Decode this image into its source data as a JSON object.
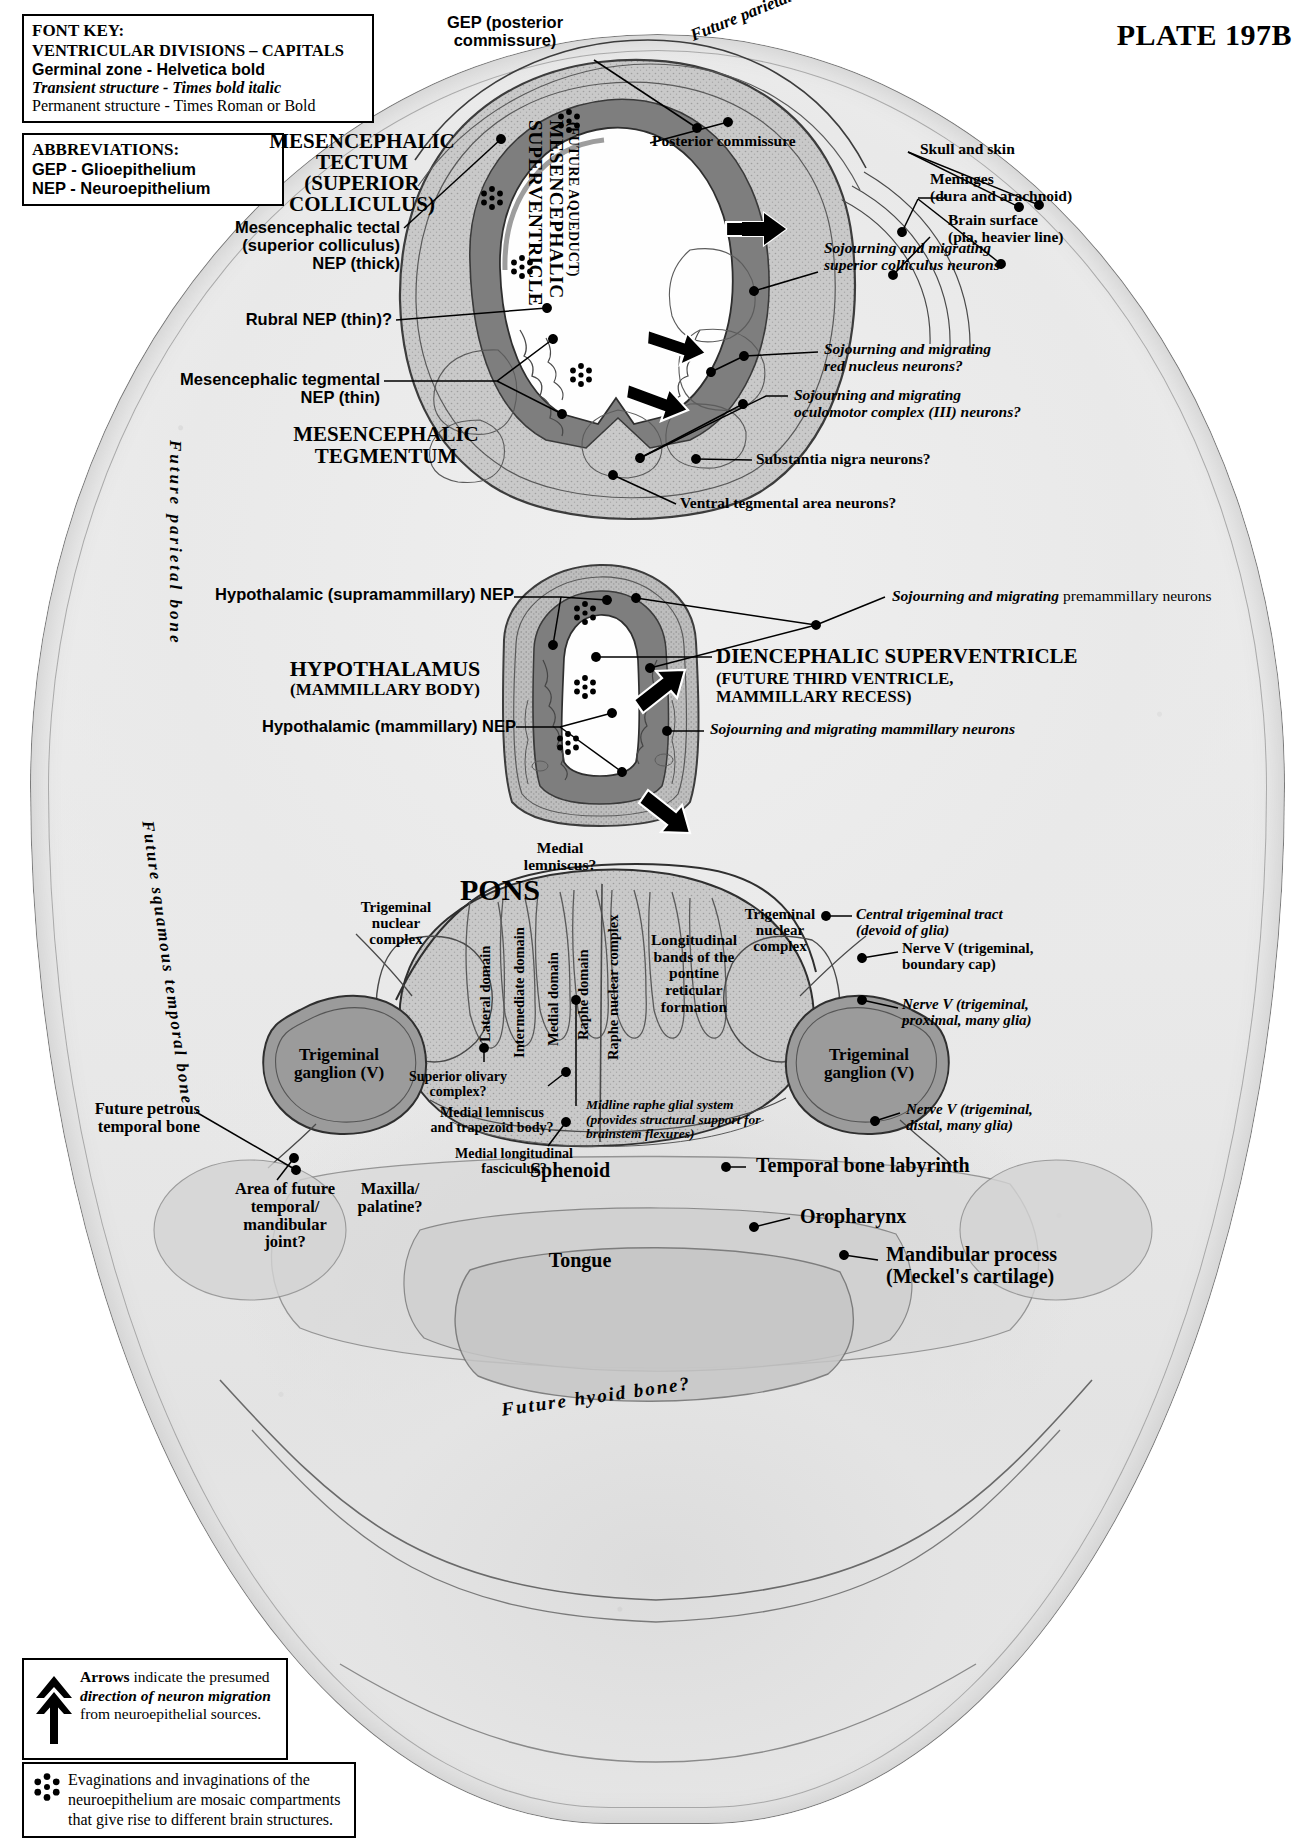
{
  "plate": {
    "title": "PLATE 197B"
  },
  "font_key": {
    "heading": "FONT KEY:",
    "lines": [
      "VENTRICULAR DIVISIONS – CAPITALS",
      "Germinal zone - Helvetica bold",
      "Transient structure - Times bold italic",
      "Permanent structure - Times Roman or Bold"
    ]
  },
  "abbreviations": {
    "heading": "ABBREVIATIONS:",
    "items": [
      "GEP - Glioepithelium",
      "NEP - Neuroepithelium"
    ]
  },
  "legend_arrows": {
    "bold_word": "Arrows",
    "text_1": " indicate the presumed ",
    "italic_phrase": "direction of neuron migration",
    "text_2": " from neuroepithelial sources."
  },
  "legend_star": {
    "text": "Evaginations and invaginations of the neuroepithelium are mosaic compartments that give rise to different brain structures."
  },
  "labels": {
    "gep_posterior_commissure": "GEP (posterior\ncommissure)",
    "posterior_commissure": "Posterior commissure",
    "future_parietal_bone_top": "Future parietal bone",
    "skull_and_skin": "Skull and skin",
    "meninges": "Meninges\n(dura and arachnoid)",
    "brain_surface": "Brain surface\n(pia, heavier line)",
    "mesencephalic_tectum": "MESENCEPHALIC\nTECTUM\n(SUPERIOR\nCOLLICULUS)",
    "mesencephalic_superventricle": "MESENCEPHALIC\nSUPERVENTRICLE",
    "mesencephalic_superventricle_sub": "(FUTURE AQUEDUCT)",
    "mesencephalic_tectal_nep": "Mesencephalic tectal\n(superior colliculus)\nNEP (thick)",
    "rubral_nep": "Rubral NEP (thin)?",
    "mesencephalic_tegmental_nep": "Mesencephalic tegmental\nNEP (thin)",
    "mesencephalic_tegmentum": "MESENCEPHALIC\nTEGMENTUM",
    "sojourning_superior_colliculus": "Sojourning and migrating\nsuperior colliculus neurons",
    "sojourning_red_nucleus": "Sojourning and migrating\nred nucleus neurons?",
    "sojourning_oculomotor": "Sojourning and migrating\noculomotor complex (III) neurons?",
    "substantia_nigra": "Substantia nigra neurons?",
    "ventral_tegmental": "Ventral tegmental area neurons?",
    "future_parietal_bone_left": "Future parietal bone",
    "future_squamous_temporal_bone": "Future squamous temporal bone",
    "hypothalamic_supramammillary_nep": "Hypothalamic (supramammillary) NEP",
    "sojourning_premammillary_italic": "Sojourning and migrating",
    "sojourning_premammillary_roman": " premammillary neurons",
    "hypothalamus": "HYPOTHALAMUS",
    "hypothalamus_sub": "(MAMMILLARY BODY)",
    "diencephalic_superventricle": "DIENCEPHALIC SUPERVENTRICLE",
    "diencephalic_superventricle_sub": "(FUTURE THIRD VENTRICLE,\nMAMMILLARY RECESS)",
    "hypothalamic_mammillary_nep": "Hypothalamic (mammillary) NEP",
    "sojourning_mammillary": "Sojourning and migrating mammillary neurons",
    "medial_lemniscus": "Medial\nlemniscus?",
    "pons": "PONS",
    "trigeminal_nuclear_complex_left": "Trigeminal\nnuclear\ncomplex",
    "trigeminal_nuclear_complex_right": "Trigeminal\nnuclear\ncomplex",
    "lateral_domain": "Lateral domain",
    "intermediate_domain": "Intermediate domain",
    "medial_domain": "Medial domain",
    "raphe_domain": "Raphe domain",
    "raphe_nuclear_complex": "Raphe nuclear complex",
    "longitudinal_bands": "Longitudinal\nbands of the\npontine\nreticular\nformation",
    "central_trigeminal_tract": "Central trigeminal tract\n(devoid of glia)",
    "nerve_v_boundary_cap": "Nerve V (trigeminal,\nboundary cap)",
    "nerve_v_proximal": "Nerve V (trigeminal,\nproximal, many glia)",
    "nerve_v_distal": "Nerve V (trigeminal,\ndistal, many glia)",
    "trigeminal_ganglion_left": "Trigeminal\nganglion (V)",
    "trigeminal_ganglion_right": "Trigeminal\nganglion (V)",
    "superior_olivary": "Superior olivary\ncomplex?",
    "medial_lemniscus_trapezoid": "Medial lemniscus\nand trapezoid body?",
    "midline_raphe_glial": "Midline raphe glial system\n(provides structural support for\nbrainstem flexures)",
    "medial_longitudinal_fasciculus": "Medial longitudinal\nfasciculus?",
    "future_petrous_temporal_bone": "Future petrous\ntemporal bone",
    "temporal_bone_labyrinth": "Temporal bone labyrinth",
    "sphenoid": "Sphenoid",
    "area_of_future_tmj": "Area of future\ntemporal/\nmandibular\njoint?",
    "maxilla_palatine": "Maxilla/\npalatine?",
    "oropharynx": "Oropharynx",
    "tongue": "Tongue",
    "mandibular_process": "Mandibular process\n(Meckel's cartilage)",
    "future_hyoid_bone": "Future hyoid bone?"
  },
  "colors": {
    "ink": "#000000",
    "paper": "#ffffff",
    "neuroepithelium": "#8d8d8d",
    "tissue_mid": "#b9b9b9",
    "tissue_light": "#d8d8d8",
    "ventricle": "#ffffff"
  }
}
